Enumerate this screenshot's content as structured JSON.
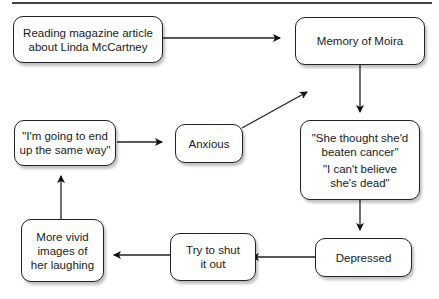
{
  "diagram": {
    "nodes": {
      "reading": {
        "lines": [
          "Reading magazine article",
          "about Linda McCartney"
        ]
      },
      "memory": {
        "lines": [
          "Memory of Moira"
        ]
      },
      "thoughts": {
        "lines": [
          "\"She thought she'd",
          "beaten cancer\"",
          "\"I can't believe",
          "she's dead\""
        ]
      },
      "depressed": {
        "lines": [
          "Depressed"
        ]
      },
      "shut": {
        "lines": [
          "Try to shut",
          "it out"
        ]
      },
      "vivid": {
        "lines": [
          "More vivid",
          "images of",
          "her laughing"
        ]
      },
      "same_way": {
        "lines": [
          "\"I'm going to end",
          "up the same way\""
        ]
      },
      "anxious": {
        "lines": [
          "Anxious"
        ]
      }
    },
    "edges": [
      {
        "from": "reading",
        "to": "memory"
      },
      {
        "from": "memory",
        "to": "thoughts"
      },
      {
        "from": "thoughts",
        "to": "depressed"
      },
      {
        "from": "depressed",
        "to": "shut"
      },
      {
        "from": "shut",
        "to": "vivid"
      },
      {
        "from": "vivid",
        "to": "same_way"
      },
      {
        "from": "same_way",
        "to": "anxious"
      },
      {
        "from": "anxious",
        "to": "memory"
      }
    ]
  }
}
